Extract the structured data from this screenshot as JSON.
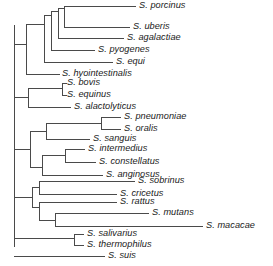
{
  "figure": {
    "kind": "phylogenetic-tree",
    "style": "rectangular-cladogram",
    "orientation": "left-to-right",
    "genus": "Streptococcus",
    "tip_count": 22,
    "line_color": "#4a4a4a",
    "text_color": "#1a1a1a",
    "background_color": "#ffffff"
  },
  "tips": [
    {
      "label": "S. porcinus",
      "y": 18,
      "branch_x": 68,
      "label_x": 139
    },
    {
      "label": "S. uberis",
      "y": 32,
      "branch_x": 62,
      "label_x": 133
    },
    {
      "label": "S. agalactiae",
      "y": 45,
      "branch_x": 56,
      "label_x": 127
    },
    {
      "label": "S. pyogenes",
      "y": 59,
      "branch_x": 45,
      "label_x": 98
    },
    {
      "label": "S. equi",
      "y": 73,
      "branch_x": 38,
      "label_x": 116
    },
    {
      "label": "S. hyointestinalis",
      "y": 86,
      "branch_x": 22,
      "label_x": 62
    },
    {
      "label": "S. bovis",
      "y": 100,
      "branch_x": 25,
      "label_x": 65
    },
    {
      "label": "S. equinus",
      "y": 113,
      "branch_x": 25,
      "label_x": 65
    },
    {
      "label": "S. alactolyticus",
      "y": 127,
      "branch_x": 21,
      "label_x": 74
    },
    {
      "label": "S. pneumoniae",
      "y": 140,
      "branch_x": 105,
      "label_x": 124
    },
    {
      "label": "S. oralis",
      "y": 152,
      "branch_x": 105,
      "label_x": 124
    },
    {
      "label": "S. sanguis",
      "y": 164,
      "branch_x": 60,
      "label_x": 93
    },
    {
      "label": "S. intermedius",
      "y": 177,
      "branch_x": 68,
      "label_x": 88
    },
    {
      "label": "S. constellatus",
      "y": 190,
      "branch_x": 68,
      "label_x": 99
    },
    {
      "label": "S. anginosus",
      "y": 202,
      "branch_x": 45,
      "label_x": 106
    },
    {
      "label": "S. sobrinus",
      "y": 215,
      "branch_x": 42,
      "label_x": 138
    },
    {
      "label": "S. cricetus",
      "y": 229,
      "branch_x": 35,
      "label_x": 120
    },
    {
      "label": "S. rattus",
      "y": 242,
      "branch_x": 42,
      "label_x": 120
    },
    {
      "label": "S. mutans",
      "y": 255,
      "branch_x": 58,
      "label_x": 152
    },
    {
      "label": "S. macacae",
      "y": 268,
      "branch_x": 58,
      "label_x": 206
    },
    {
      "label": "S. salivarius",
      "y": 281,
      "branch_x": 77,
      "label_x": 87
    },
    {
      "label": "S. thermophilus",
      "y": 295,
      "branch_x": 77,
      "label_x": 87
    },
    {
      "label": "S. suis",
      "y": 308,
      "branch_x": 14,
      "label_x": 108
    }
  ]
}
